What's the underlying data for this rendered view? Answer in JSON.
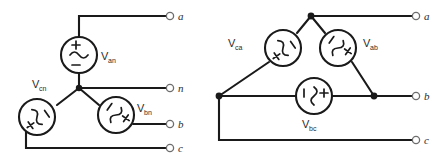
{
  "figure": {
    "background_color": "#ffffff",
    "wire_color": "#1a1a1a",
    "label_color": "#2b2b2b",
    "terminal_color": "#6e6e6e"
  },
  "wye": {
    "name": "wye-connected-source",
    "center_node_label": "",
    "sources": [
      {
        "id": "van",
        "label_v": "V",
        "label_sub": "an",
        "orientation": "vertical-up",
        "glyph": "ac-source-icon",
        "plus": "+",
        "minus": "−",
        "wave": "~"
      },
      {
        "id": "vbn",
        "label_v": "V",
        "label_sub": "bn",
        "orientation": "rotated-ccw",
        "glyph": "ac-source-icon",
        "plus": "+",
        "minus": "−",
        "wave": "~"
      },
      {
        "id": "vcn",
        "label_v": "V",
        "label_sub": "cn",
        "orientation": "rotated-cw",
        "glyph": "ac-source-icon",
        "plus": "+",
        "minus": "−",
        "wave": "~"
      }
    ],
    "terminals": [
      {
        "id": "a",
        "label": "a"
      },
      {
        "id": "n",
        "label": "n"
      },
      {
        "id": "b",
        "label": "b"
      },
      {
        "id": "c",
        "label": "c"
      }
    ]
  },
  "delta": {
    "name": "delta-connected-source",
    "sources": [
      {
        "id": "vab",
        "label_v": "V",
        "label_sub": "ab",
        "orientation": "rotated-cw",
        "glyph": "ac-source-icon",
        "plus": "+",
        "minus": "−",
        "wave": "~"
      },
      {
        "id": "vbc",
        "label_v": "V",
        "label_sub": "bc",
        "orientation": "rotated-90",
        "glyph": "ac-source-icon",
        "plus": "+",
        "minus": "−",
        "wave": "~"
      },
      {
        "id": "vca",
        "label_v": "V",
        "label_sub": "ca",
        "orientation": "rotated-ccw",
        "glyph": "ac-source-icon",
        "plus": "+",
        "minus": "−",
        "wave": "~"
      }
    ],
    "terminals": [
      {
        "id": "a",
        "label": "a"
      },
      {
        "id": "b",
        "label": "b"
      },
      {
        "id": "c",
        "label": "c"
      }
    ]
  }
}
